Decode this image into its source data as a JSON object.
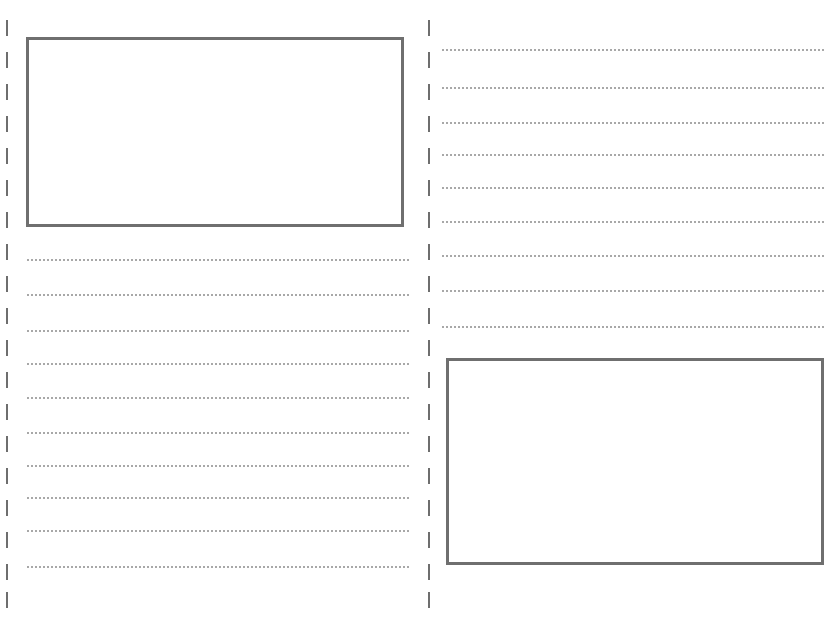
{
  "document": {
    "type": "blank lined worksheet with picture boxes",
    "background": "#ffffff",
    "border_color": "#6f6f6f",
    "dot_color": "#a8a8a8"
  },
  "left_panel": {
    "picture_box": {
      "x": 26,
      "y": 37,
      "w": 378,
      "h": 190
    },
    "writing_lines_count": 10,
    "writing_lines_y": [
      259,
      294,
      330,
      363,
      397,
      432,
      465,
      497,
      530,
      566
    ],
    "line_x": 27,
    "line_w": 382
  },
  "right_panel": {
    "picture_box": {
      "x": 446,
      "y": 358,
      "w": 378,
      "h": 207
    },
    "writing_lines_count": 9,
    "writing_lines_y": [
      49,
      87,
      122,
      154,
      187,
      221,
      255,
      290,
      326
    ],
    "line_x": 442,
    "line_w": 382
  },
  "fold_lines": [
    {
      "x": 6,
      "dashes_y": [
        20,
        52,
        84,
        116,
        148,
        180,
        212,
        244,
        276,
        308,
        340,
        372,
        404,
        436,
        468,
        500,
        532,
        564,
        592
      ]
    },
    {
      "x": 428,
      "dashes_y": [
        20,
        52,
        84,
        116,
        148,
        180,
        212,
        244,
        276,
        308,
        340,
        372,
        404,
        436,
        468,
        500,
        532,
        564,
        592
      ]
    }
  ]
}
